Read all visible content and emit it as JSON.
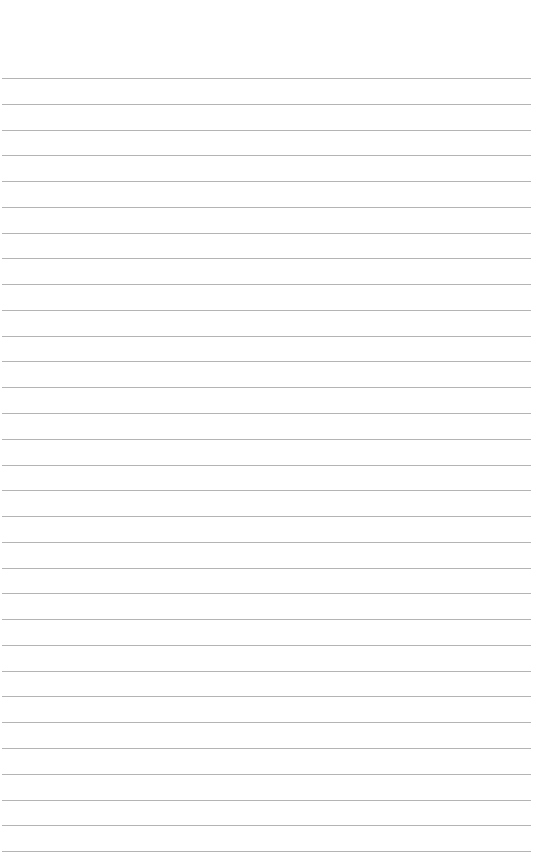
{
  "page": {
    "type": "lined-paper",
    "background_color": "#ffffff",
    "line_color": "#b4b4b4",
    "line_count": 31,
    "first_line_y": 78,
    "line_spacing": 25.77,
    "line_left": 2,
    "line_right": 531
  }
}
